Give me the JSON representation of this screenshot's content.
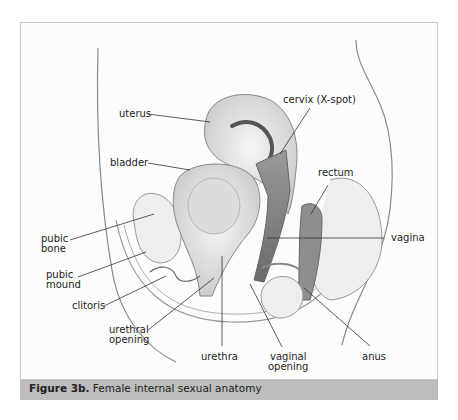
{
  "figure": {
    "caption_prefix": "Figure 3b.",
    "caption_text": " Female internal sexual anatomy"
  },
  "labels": {
    "uterus": "uterus",
    "cervix": "cervix (X-spot)",
    "bladder": "bladder",
    "rectum": "rectum",
    "pubic_bone_1": "pubic",
    "pubic_bone_2": "bone",
    "vagina": "vagina",
    "pubic_mound_1": "pubic",
    "pubic_mound_2": "mound",
    "clitoris": "clitoris",
    "urethral_opening_1": "urethral",
    "urethral_opening_2": "opening",
    "urethra": "urethra",
    "vaginal_opening_1": "vaginal",
    "vaginal_opening_2": "opening",
    "anus": "anus"
  },
  "colors": {
    "caption_bg": "#bdbdbd",
    "frame_border": "#c8c8c8",
    "line": "#333333"
  }
}
